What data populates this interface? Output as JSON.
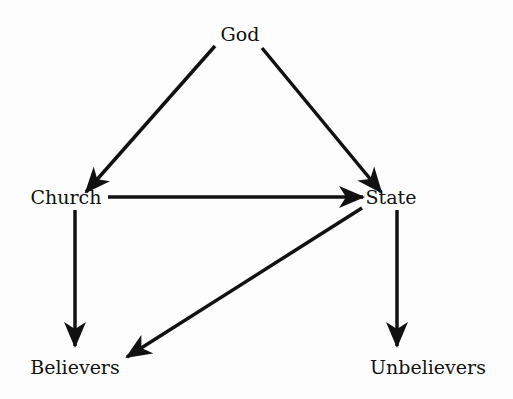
{
  "diagram": {
    "type": "directed-graph",
    "colors": {
      "background": "#fdfdfd",
      "ink": "#111111"
    },
    "nodes": [
      {
        "id": "god",
        "label": "God",
        "x": 240,
        "y": 34
      },
      {
        "id": "church",
        "label": "Church",
        "x": 66,
        "y": 197
      },
      {
        "id": "state",
        "label": "State",
        "x": 391,
        "y": 197
      },
      {
        "id": "believers",
        "label": "Believers",
        "x": 75,
        "y": 367
      },
      {
        "id": "unbelievers",
        "label": "Unbelievers",
        "x": 428,
        "y": 367
      }
    ],
    "edges": [
      {
        "from": "God",
        "to": "Church"
      },
      {
        "from": "God",
        "to": "State"
      },
      {
        "from": "Church",
        "to": "State"
      },
      {
        "from": "Church",
        "to": "Believers"
      },
      {
        "from": "State",
        "to": "Believers"
      },
      {
        "from": "State",
        "to": "Unbelievers"
      }
    ]
  }
}
